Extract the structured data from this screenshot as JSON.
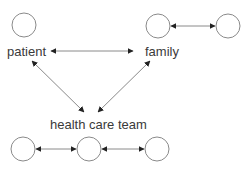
{
  "diagram": {
    "labels": {
      "patient": "patient",
      "family": "family",
      "team": "health care team"
    },
    "nodes": [
      {
        "id": "patient-circle",
        "cx": 24,
        "cy": 25,
        "r": 12
      },
      {
        "id": "family-circle-1",
        "cx": 158,
        "cy": 26,
        "r": 12
      },
      {
        "id": "family-circle-2",
        "cx": 228,
        "cy": 26,
        "r": 12
      },
      {
        "id": "team-circle-1",
        "cx": 23,
        "cy": 149,
        "r": 12
      },
      {
        "id": "team-circle-2",
        "cx": 89,
        "cy": 149,
        "r": 12
      },
      {
        "id": "team-circle-3",
        "cx": 157,
        "cy": 149,
        "r": 12
      }
    ],
    "edges": [
      {
        "from": "patient",
        "to": "family",
        "type": "bidirectional"
      },
      {
        "from": "health care team",
        "to": "patient",
        "type": "directed"
      },
      {
        "from": "health care team",
        "to": "family",
        "type": "directed"
      },
      {
        "from": "family-circle-1",
        "to": "family-circle-2",
        "type": "bidirectional"
      },
      {
        "from": "team-circle-1",
        "to": "team-circle-2",
        "type": "bidirectional"
      },
      {
        "from": "team-circle-2",
        "to": "team-circle-3",
        "type": "bidirectional"
      }
    ],
    "colors": {
      "stroke": "#7a7a7a",
      "arrow": "#222222",
      "text": "#3a3a3a"
    }
  }
}
